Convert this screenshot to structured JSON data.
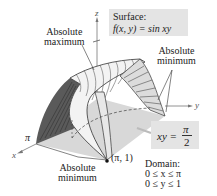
{
  "figure": {
    "surface_box": {
      "title": "Surface:",
      "equation": "f(x, y) = sin xy"
    },
    "labels": {
      "absolute_maximum_line1": "Absolute",
      "absolute_maximum_line2": "maximum",
      "absolute_minimum_right_line1": "Absolute",
      "absolute_minimum_right_line2": "minimum",
      "absolute_minimum_bottom_line1": "Absolute",
      "absolute_minimum_bottom_line2": "minimum",
      "point": "(π, 1)",
      "pi_tick": "π"
    },
    "curve_box": {
      "lhs": "xy =",
      "numerator": "π",
      "denominator": "2"
    },
    "domain": {
      "title": "Domain:",
      "line1": "0 ≤ x ≤ π",
      "line2": "0 ≤ y ≤ 1"
    },
    "axes": {
      "x": "x",
      "y": "y",
      "z": "z"
    },
    "colors": {
      "surface_box_bg": "#e4e4e4",
      "base_plane": "#d8d8d8",
      "surface_light": "#f2f2f2",
      "surface_dark": "#6a6a6a",
      "line": "#333333"
    }
  }
}
